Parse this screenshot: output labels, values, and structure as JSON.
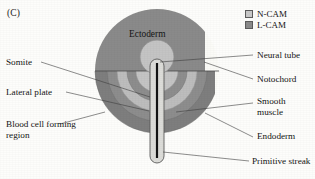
{
  "figure": {
    "panel_label": "(C)",
    "background_color": "#fdfdfb"
  },
  "legend": {
    "items": [
      {
        "label": "N-CAM",
        "color": "#c9c9c9",
        "icon": "legend-swatch-icon"
      },
      {
        "label": "L-CAM",
        "color": "#8a8a8a",
        "icon": "legend-swatch-icon"
      }
    ]
  },
  "diagram": {
    "type": "embryo-cross-section",
    "inner_labels": [
      {
        "name": "ectoderm",
        "text": "Ectoderm",
        "x": 129,
        "y": 36
      }
    ],
    "regions": [
      {
        "name": "ectoderm",
        "marker": "L-CAM",
        "color": "#8a8a8a"
      },
      {
        "name": "neural-tube",
        "marker": "N-CAM",
        "color": "#c4c4c4"
      },
      {
        "name": "somite",
        "marker": "N-CAM",
        "color": "#c4c4c4"
      },
      {
        "name": "smooth-muscle",
        "marker": "N-CAM",
        "color": "#bdbdbd"
      },
      {
        "name": "lateral-plate",
        "marker": "L-CAM",
        "color": "#858585"
      },
      {
        "name": "endoderm",
        "marker": "L-CAM",
        "color": "#7e7e7e"
      },
      {
        "name": "notochord",
        "marker": "none",
        "color": "#1a1a1a"
      },
      {
        "name": "primitive-streak",
        "marker": "none",
        "color": "#1a1a1a"
      },
      {
        "name": "blood-cell-forming-region",
        "marker": "none",
        "color": "#fbfbf7"
      }
    ]
  },
  "callouts": {
    "left": [
      {
        "id": "somite",
        "label": "Somite",
        "x": 6,
        "y": 62
      },
      {
        "id": "lateral-plate",
        "label": "Lateral plate",
        "x": 6,
        "y": 92
      },
      {
        "id": "blood-cell-forming-region",
        "label": "Blood cell forming region",
        "x": 6,
        "y": 124
      }
    ],
    "right": [
      {
        "id": "neural-tube",
        "label": "Neural tube",
        "x": 257,
        "y": 55
      },
      {
        "id": "notochord",
        "label": "Notochord",
        "x": 257,
        "y": 79
      },
      {
        "id": "smooth-muscle",
        "label": "Smooth muscle",
        "x": 257,
        "y": 101
      },
      {
        "id": "endoderm",
        "label": "Endoderm",
        "x": 257,
        "y": 135
      },
      {
        "id": "primitive-streak",
        "label": "Primitive streak",
        "x": 253,
        "y": 160
      }
    ]
  }
}
